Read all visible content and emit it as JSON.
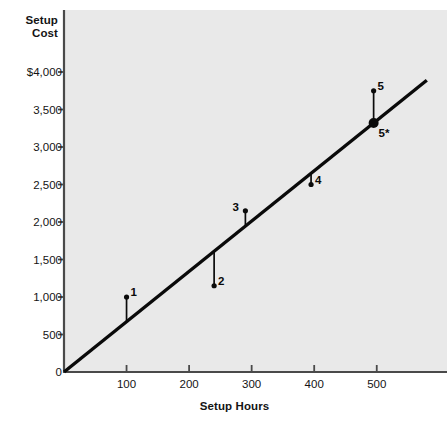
{
  "chart_data": {
    "type": "scatter",
    "title": "",
    "xlabel": "Setup Hours",
    "ylabel_line1": "Setup",
    "ylabel_line2": "Cost",
    "xlim": [
      0,
      612
    ],
    "ylim": [
      0,
      4000
    ],
    "grid": false,
    "legend": "none",
    "xticks": [
      {
        "value": 100,
        "label": "100"
      },
      {
        "value": 200,
        "label": "200"
      },
      {
        "value": 300,
        "label": "300"
      },
      {
        "value": 400,
        "label": "400"
      },
      {
        "value": 500,
        "label": "500"
      }
    ],
    "yticks": [
      {
        "value": 0,
        "label": "0"
      },
      {
        "value": 500,
        "label": "500"
      },
      {
        "value": 1000,
        "label": "1,000"
      },
      {
        "value": 1500,
        "label": "1,500"
      },
      {
        "value": 2000,
        "label": "2,000"
      },
      {
        "value": 2500,
        "label": "2,500"
      },
      {
        "value": 3000,
        "label": "3,000"
      },
      {
        "value": 3500,
        "label": "3,500"
      },
      {
        "value": 4000,
        "label": "$4,000"
      }
    ],
    "series": [
      {
        "name": "observations",
        "points": [
          {
            "label": "1",
            "x": 100,
            "y": 1000,
            "fit_y": 670,
            "label_side": "right",
            "marker": "small"
          },
          {
            "label": "2",
            "x": 240,
            "y": 1150,
            "fit_y": 1610,
            "label_side": "right",
            "marker": "small"
          },
          {
            "label": "3",
            "x": 290,
            "y": 2150,
            "fit_y": 1950,
            "label_side": "left",
            "marker": "small"
          },
          {
            "label": "4",
            "x": 395,
            "y": 2500,
            "fit_y": 2650,
            "label_side": "right",
            "marker": "small"
          },
          {
            "label": "5",
            "x": 495,
            "y": 3750,
            "fit_y": 3320,
            "label_side": "right",
            "marker": "small"
          },
          {
            "label": "5*",
            "x": 495,
            "y": 3320,
            "fit_y": 3320,
            "label_side": "below",
            "marker": "large"
          }
        ]
      }
    ],
    "regression_line": {
      "name": "cost line",
      "x_start": 0,
      "y_start": 0,
      "x_end": 580,
      "y_end": 3890
    },
    "colors": {
      "plot_background": "#e9e9e9",
      "page_background": "#ffffff",
      "axis": "#4a4a4a",
      "line": "#0a0a0a",
      "marker": "#0a0a0a",
      "text": "#141414"
    }
  }
}
